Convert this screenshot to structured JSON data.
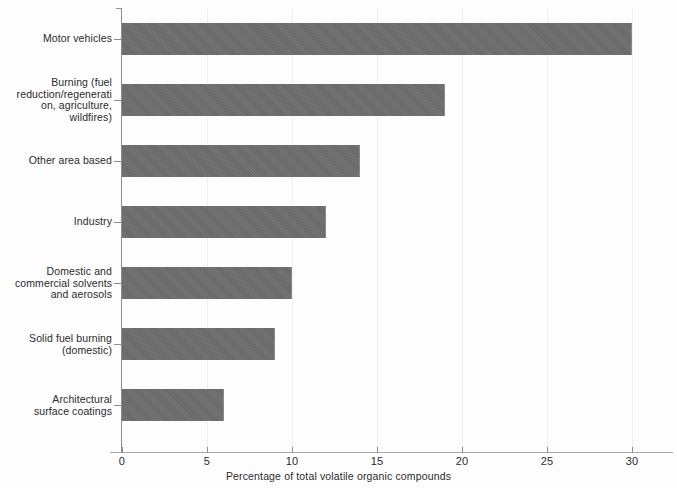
{
  "chart_data": {
    "type": "bar",
    "orientation": "horizontal",
    "title": "",
    "xlabel": "Percentage of total volatile organic compounds",
    "ylabel": "",
    "xlim": [
      0,
      32.4
    ],
    "ylim": null,
    "grid": "vertical-light",
    "legend": null,
    "bar_color": "#6d6d6d",
    "background_color": "#fdfdfd",
    "xticks": [
      0,
      5,
      10,
      15,
      20,
      25,
      30
    ],
    "xtick_labels": [
      "0",
      "5",
      "10",
      "15",
      "20",
      "25",
      "30"
    ],
    "categories": [
      "Motor vehicles",
      "Burning (fuel reduction/regenerati on, agriculture, wildfires)",
      "Other area based",
      "Industry",
      "Domestic and commercial solvents and aerosols",
      "Solid fuel burning (domestic)",
      "Architectural surface coatings"
    ],
    "category_lines": [
      [
        "Motor vehicles"
      ],
      [
        "Burning (fuel",
        "reduction/regenerati",
        "on, agriculture,",
        "wildfires)"
      ],
      [
        "Other area based"
      ],
      [
        "Industry"
      ],
      [
        "Domestic and",
        "commercial solvents",
        "and aerosols"
      ],
      [
        "Solid fuel burning",
        "(domestic)"
      ],
      [
        "Architectural",
        "surface coatings"
      ]
    ],
    "values": [
      30,
      19,
      14,
      12,
      10,
      9,
      6
    ],
    "units": "percent"
  },
  "geometry": {
    "origin_x": 122,
    "px_per_unit": 17.0,
    "axis_y": 452,
    "axis_top": 8,
    "bar_height": 32,
    "bar_tops": [
      23,
      84,
      145,
      206,
      267,
      328,
      389
    ]
  }
}
